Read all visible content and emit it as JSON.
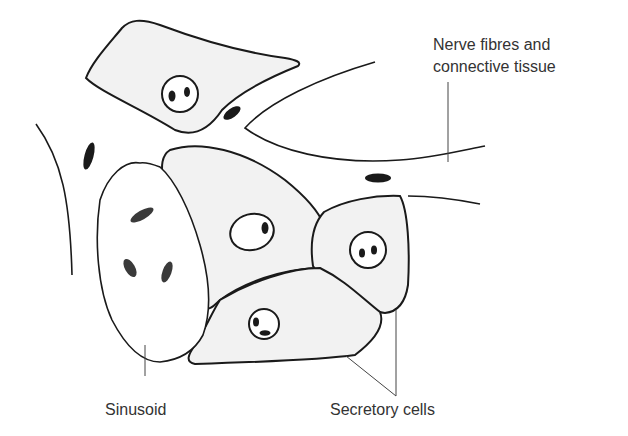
{
  "labels": {
    "nerve_line1": "Nerve fibres and",
    "nerve_line2": "connective tissue",
    "sinusoid": "Sinusoid",
    "secretory": "Secretory cells"
  },
  "colors": {
    "cell_fill": "#f2f2f2",
    "outline": "#1a1a1a",
    "label_text": "#333333"
  }
}
